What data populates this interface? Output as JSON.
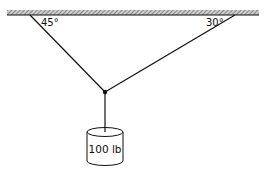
{
  "diagram": {
    "type": "statics-free-body",
    "ceiling": {
      "style": "hatched"
    },
    "ropes": [
      {
        "id": "left",
        "angle_label": "45°"
      },
      {
        "id": "right",
        "angle_label": "30°"
      }
    ],
    "weight": {
      "label": "100 lb",
      "shape": "cylinder"
    }
  },
  "colors": {
    "line": "#111111",
    "hatch": "#777777",
    "background": "#ffffff"
  }
}
